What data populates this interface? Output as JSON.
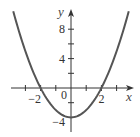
{
  "chart_data": {
    "type": "line",
    "title": "",
    "function": "y = x^2 - 4",
    "xlabel": "x",
    "ylabel": "y",
    "xlim": [
      -3.87,
      4.2
    ],
    "ylim": [
      -5.9,
      10.8
    ],
    "x_tick_values": [
      -3,
      -2,
      -1,
      0,
      1,
      2,
      3
    ],
    "x_tick_labels": [
      {
        "value": -2,
        "text": "−2"
      },
      {
        "value": 2,
        "text": "2"
      }
    ],
    "origin_label": "0",
    "y_tick_values": [
      -4,
      -2,
      2,
      4,
      6,
      8
    ],
    "y_tick_labels": [
      {
        "value": 8,
        "text": "8"
      },
      {
        "value": 4,
        "text": "4"
      },
      {
        "value": -4,
        "text": "−4"
      }
    ],
    "series": [
      {
        "name": "parabola",
        "x": [
          -3.8,
          -3.5,
          -3,
          -2.5,
          -2,
          -1.5,
          -1,
          -0.5,
          0,
          0.5,
          1,
          1.5,
          2,
          2.5,
          3,
          3.5,
          3.8
        ],
        "values": [
          10.44,
          8.25,
          5,
          2.25,
          0,
          -1.75,
          -3,
          -3.75,
          -4,
          -3.75,
          -3,
          -1.75,
          0,
          2.25,
          5,
          8.25,
          10.44
        ]
      }
    ],
    "key_points": {
      "x_intercepts": [
        -2,
        2
      ],
      "y_intercept": -4,
      "vertex": [
        0,
        -4
      ]
    },
    "grid": false,
    "legend": null
  },
  "colors": {
    "curve": "#555555",
    "axes": "#333333",
    "labels": "#333333"
  }
}
